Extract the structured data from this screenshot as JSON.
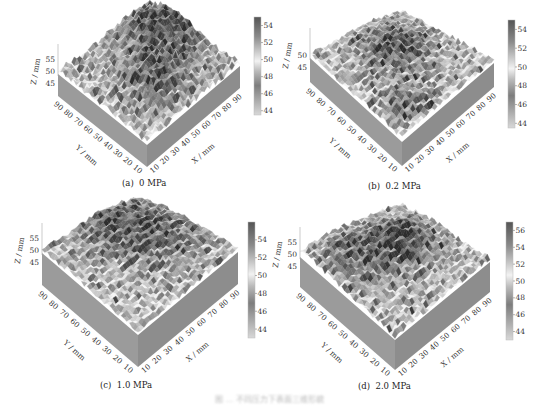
{
  "figure": {
    "caption": "图 ... 不同压力下表面三维形貌",
    "panels": [
      "(a)  0 MPa",
      "(b)  0.2 MPa",
      "(c)  1.0 MPa",
      "(d)  2.0 MPa"
    ]
  },
  "chart_data": [
    {
      "type": "heatmap",
      "subtype": "3d-surface",
      "title": "(a)  0 MPa",
      "xlabel": "X / mm",
      "ylabel": "Y / mm",
      "zlabel": "Z / mm",
      "x_ticks": [
        10,
        20,
        30,
        40,
        50,
        60,
        70,
        80,
        90
      ],
      "y_ticks": [
        10,
        20,
        30,
        40,
        50,
        60,
        70,
        80,
        90
      ],
      "z_ticks": [
        45,
        50,
        55
      ],
      "colorbar_ticks": [
        44,
        46,
        48,
        50,
        52,
        54
      ],
      "colorbar_range": [
        43.5,
        55
      ],
      "colormap": "gray (dark = high)",
      "description": "Dark elevated ridge running diagonally from back-left to center-right"
    },
    {
      "type": "heatmap",
      "subtype": "3d-surface",
      "title": "(b)  0.2 MPa",
      "xlabel": "X / mm",
      "ylabel": "Y / mm",
      "zlabel": "Z / mm",
      "x_ticks": [
        10,
        20,
        30,
        40,
        50,
        60,
        70,
        80,
        90
      ],
      "y_ticks": [
        10,
        20,
        30,
        40,
        50,
        60,
        70,
        80,
        90
      ],
      "z_ticks": [
        45,
        50
      ],
      "colorbar_ticks": [
        44,
        46,
        48,
        50,
        52,
        54
      ],
      "colorbar_range": [
        43.5,
        55
      ],
      "colormap": "gray (dark = high)",
      "description": "Rough surface with dark patches in back-center and right"
    },
    {
      "type": "heatmap",
      "subtype": "3d-surface",
      "title": "(c)  1.0 MPa",
      "xlabel": "X / mm",
      "ylabel": "Y / mm",
      "zlabel": "Z / mm",
      "x_ticks": [
        10,
        20,
        30,
        40,
        50,
        60,
        70,
        80,
        90
      ],
      "y_ticks": [
        10,
        20,
        30,
        40,
        50,
        60,
        70,
        80,
        90
      ],
      "z_ticks": [
        45,
        50,
        55
      ],
      "colorbar_ticks": [
        44,
        46,
        48,
        50,
        52,
        54
      ],
      "colorbar_range": [
        43,
        56
      ],
      "colormap": "gray (dark = high)",
      "description": "Smoother surface, high region toward back"
    },
    {
      "type": "heatmap",
      "subtype": "3d-surface",
      "title": "(d)  2.0 MPa",
      "xlabel": "X / mm",
      "ylabel": "Y / mm",
      "zlabel": "Z / mm",
      "x_ticks": [
        10,
        20,
        30,
        40,
        50,
        60,
        70,
        80,
        90
      ],
      "y_ticks": [
        10,
        20,
        30,
        40,
        50,
        60,
        70,
        80,
        90
      ],
      "z_ticks": [
        45,
        50,
        55
      ],
      "colorbar_ticks": [
        44,
        46,
        48,
        50,
        52,
        54,
        56
      ],
      "colorbar_range": [
        43,
        57
      ],
      "colormap": "gray (dark = high)",
      "description": "Pronounced ridges with dark peak near back center"
    }
  ],
  "colors": {
    "box_side_left": "#9a9a9a",
    "box_side_right": "#8c8c8c",
    "text": "#333333"
  }
}
